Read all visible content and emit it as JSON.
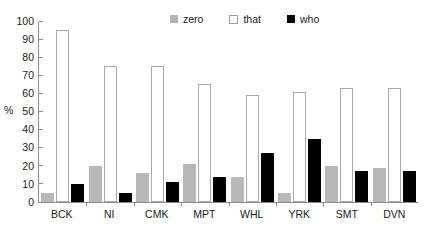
{
  "chart_data": {
    "type": "bar",
    "title": "",
    "subtitle": "",
    "xlabel": "",
    "ylabel": "%",
    "ylim": [
      0,
      100
    ],
    "yticks": [
      0,
      10,
      20,
      30,
      40,
      50,
      60,
      70,
      80,
      90,
      100
    ],
    "grid": false,
    "legend_position": "top-center",
    "categories": [
      "BCK",
      "NI",
      "CMK",
      "MPT",
      "WHL",
      "YRK",
      "SMT",
      "DVN"
    ],
    "series": [
      {
        "name": "zero",
        "color": "#b8b8b8",
        "values": [
          5,
          20,
          16,
          21,
          14,
          5,
          20,
          19
        ]
      },
      {
        "name": "that",
        "color": "#ffffff",
        "values": [
          95,
          75,
          75,
          65,
          59,
          61,
          63,
          63
        ]
      },
      {
        "name": "who",
        "color": "#000000",
        "values": [
          10,
          5,
          11,
          14,
          27,
          35,
          17,
          17
        ]
      }
    ]
  },
  "legend": {
    "entries": [
      {
        "label": "zero",
        "swatch": "gray-square-swatch"
      },
      {
        "label": "that",
        "swatch": "white-outlined-square-swatch"
      },
      {
        "label": "who",
        "swatch": "black-square-swatch"
      }
    ]
  },
  "axes": {
    "y_title": "%",
    "y_tick_labels": [
      "100",
      "90",
      "80",
      "70",
      "60",
      "50",
      "40",
      "30",
      "20",
      "10",
      "0"
    ],
    "x_tick_labels": [
      "BCK",
      "NI",
      "CMK",
      "MPT",
      "WHL",
      "YRK",
      "SMT",
      "DVN"
    ]
  },
  "colors": {
    "zero": "#b8b8b8",
    "that": "#ffffff",
    "who": "#000000",
    "axis": "#8c8c8c",
    "text": "#1a1a1a",
    "background": "#ffffff"
  }
}
